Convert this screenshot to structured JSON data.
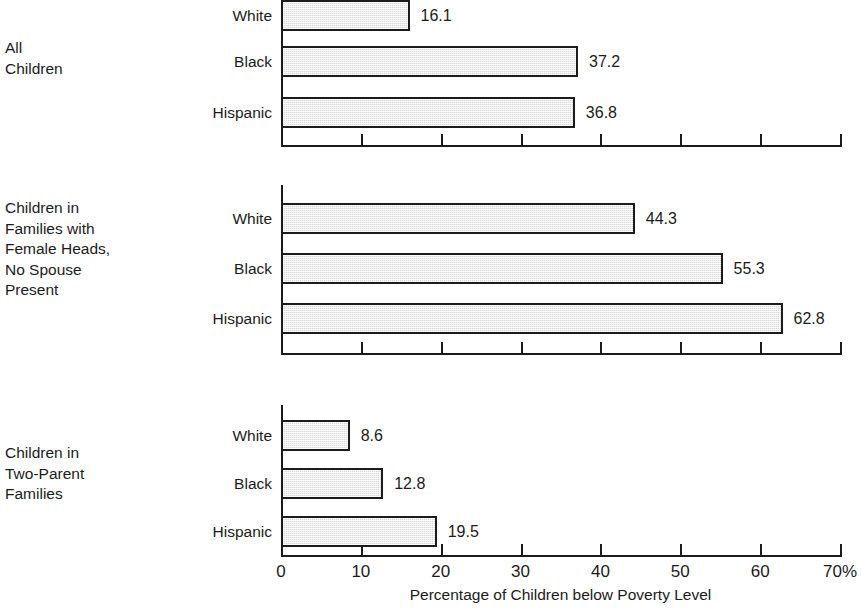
{
  "chart_data": {
    "type": "bar",
    "orientation": "horizontal",
    "title": "",
    "xlabel": "Percentage of Children below Poverty Level",
    "ylabel": "",
    "xlim": [
      0,
      70
    ],
    "xticks": [
      0,
      10,
      20,
      30,
      40,
      50,
      60,
      70
    ],
    "xtick_labels": [
      "0",
      "10",
      "20",
      "30",
      "40",
      "50",
      "60",
      "70%"
    ],
    "grid": false,
    "legend": false,
    "categories": [
      "White",
      "Black",
      "Hispanic"
    ],
    "panels": [
      {
        "label": "All\nChildren",
        "categories": [
          "White",
          "Black",
          "Hispanic"
        ],
        "values": [
          16.1,
          37.2,
          36.8
        ],
        "value_labels": [
          "16.1",
          "37.2",
          "36.8"
        ]
      },
      {
        "label": "Children in\nFamilies with\nFemale Heads,\nNo Spouse\nPresent",
        "categories": [
          "White",
          "Black",
          "Hispanic"
        ],
        "values": [
          44.3,
          55.3,
          62.8
        ],
        "value_labels": [
          "44.3",
          "55.3",
          "62.8"
        ]
      },
      {
        "label": "Children in\nTwo-Parent\nFamilies",
        "categories": [
          "White",
          "Black",
          "Hispanic"
        ],
        "values": [
          8.6,
          12.8,
          19.5
        ],
        "value_labels": [
          "8.6",
          "12.8",
          "19.5"
        ]
      }
    ],
    "colors": {
      "bar_fill": "#d9d9d9",
      "bar_border": "#1b1b1b",
      "axis": "#1b1b1b",
      "text": "#1b1b1b",
      "background": "#ffffff"
    }
  }
}
